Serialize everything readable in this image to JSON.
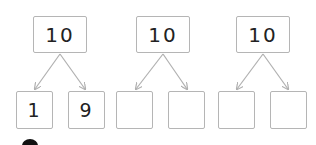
{
  "trees": [
    {
      "top": "10",
      "left": "1",
      "right": "9"
    },
    {
      "top": "10",
      "left": "",
      "right": ""
    },
    {
      "top": "10",
      "left": "",
      "right": ""
    }
  ],
  "colors": {
    "border": "#b5b5b5",
    "arrow": "#b0b0b0",
    "text": "#222222"
  }
}
